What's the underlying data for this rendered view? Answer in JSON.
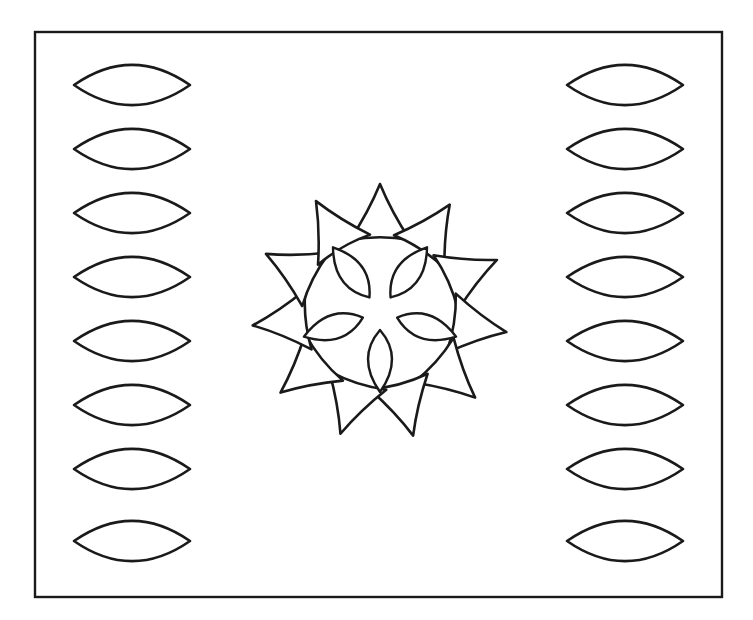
{
  "artwork": {
    "title": "Sun Mandala Coloring Page",
    "style": "black-and-white line art",
    "background_color": "#ffffff",
    "stroke_color": "#1a1a1a",
    "canvas": {
      "width": 753,
      "height": 620
    }
  },
  "frame": {
    "name": "border-rectangle",
    "x": 35,
    "y": 32,
    "width": 687,
    "height": 565,
    "stroke_width": 2.4
  },
  "side_panels": {
    "count": 2,
    "shape": "lens",
    "shapes_per_column": 8,
    "left_column": {
      "label": "left-lens-column",
      "center_x": 132,
      "half_width": 58,
      "half_height": 25,
      "bulge": 0.62,
      "start_y": 85,
      "spacing": 64,
      "items_y": [
        85,
        149,
        213,
        277,
        341,
        405,
        469,
        541
      ]
    },
    "right_column": {
      "label": "right-lens-column",
      "center_x": 625,
      "half_width": 58,
      "half_height": 25,
      "bulge": 0.62,
      "start_y": 85,
      "spacing": 64,
      "items_y": [
        85,
        149,
        213,
        277,
        341,
        405,
        469,
        541
      ]
    }
  },
  "mandala": {
    "name": "central-sun-mandala",
    "center_x": 380,
    "center_y": 312,
    "inner_petals": {
      "count": 5,
      "shape": "pointed-oval-petal",
      "length": 62,
      "width": 24,
      "inner_radius": 18,
      "angles_deg": [
        -54,
        -126,
        18,
        162,
        90
      ],
      "description": "five pointed-oval petals radiating from the centre"
    },
    "outer_rays": {
      "count": 11,
      "shape": "curved-sided-triangle",
      "inner_radius": 72,
      "outer_radius": 128,
      "base_half_width": 30,
      "curve_inset": 10,
      "angles_deg": [
        -90,
        -57,
        -24,
        9,
        42,
        75,
        108,
        141,
        174,
        207,
        240
      ],
      "description": "ring of eleven triangular rays pointing outward"
    }
  },
  "meta": {
    "shape_names": {
      "lens": "lens-shape",
      "petal": "petal-shape",
      "ray": "triangle-ray-shape",
      "frame": "frame-shape"
    }
  }
}
